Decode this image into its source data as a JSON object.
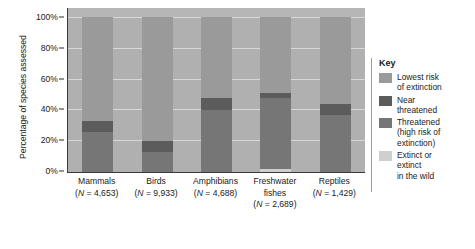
{
  "chart_data": {
    "type": "bar",
    "subtype": "stacked-percentage",
    "title": "",
    "xlabel": "",
    "ylabel": "Percentage of species assessed",
    "ylim": [
      0,
      100
    ],
    "ytick_labels": [
      "0%",
      "20%",
      "40%",
      "60%",
      "80%",
      "100%"
    ],
    "ytick_values": [
      0,
      20,
      40,
      60,
      80,
      100
    ],
    "grid": true,
    "legend_position": "right",
    "categories": [
      "Mammals",
      "Birds",
      "Amphibians",
      "Freshwater fishes",
      "Reptiles"
    ],
    "category_sample_sizes": [
      "(N = 4,653)",
      "(N = 9,933)",
      "(N = 4,688)",
      "(N = 2,689)",
      "(N = 1,429)"
    ],
    "series": [
      {
        "name": "Lowest risk of extinction",
        "color": "#9a9a9a",
        "values": [
          67,
          80,
          52,
          49,
          56
        ]
      },
      {
        "name": "Near threatened",
        "color": "#5c5c5c",
        "values": [
          7,
          7,
          8,
          3,
          7
        ]
      },
      {
        "name": "Threatened (high risk of extinction)",
        "color": "#767676",
        "values": [
          26,
          13,
          40,
          46,
          37
        ]
      },
      {
        "name": "Extinct or extinct in the wild",
        "color": "#cfcfcf",
        "values": [
          0,
          0,
          0,
          2,
          0
        ]
      }
    ]
  },
  "legend": {
    "title": "Key",
    "items": [
      {
        "label": "Lowest risk\nof extinction",
        "line1": "Lowest risk",
        "line2": "of extinction",
        "color": "#9a9a9a"
      },
      {
        "label": "Near\nthreatened",
        "line1": "Near",
        "line2": "threatened",
        "color": "#5c5c5c"
      },
      {
        "label": "Threatened\n(high risk of\nextinction)",
        "line1": "Threatened",
        "line2": "(high risk of",
        "line3": "extinction)",
        "color": "#767676"
      },
      {
        "label": "Extinct or\nextinct\nin the wild",
        "line1": "Extinct or",
        "line2": "extinct",
        "line3": "in the wild",
        "color": "#cfcfcf"
      }
    ]
  },
  "axis": {
    "y_title": "Percentage of species assessed",
    "ticks": [
      {
        "label": "100%",
        "value": 100
      },
      {
        "label": "80%",
        "value": 80
      },
      {
        "label": "60%",
        "value": 60
      },
      {
        "label": "40%",
        "value": 40
      },
      {
        "label": "20%",
        "value": 20
      },
      {
        "label": "0%",
        "value": 0
      }
    ]
  },
  "xaxis_labels": [
    {
      "name": "Mammals",
      "n": "(N = 4,653)",
      "n_prefix": "(",
      "n_italic": "N",
      "n_rest": " = 4,653)"
    },
    {
      "name": "Birds",
      "n": "(N = 9,933)",
      "n_prefix": "(",
      "n_italic": "N",
      "n_rest": " = 9,933)"
    },
    {
      "name": "Amphibians",
      "n": "(N = 4,688)",
      "n_prefix": "(",
      "n_italic": "N",
      "n_rest": " = 4,688)"
    },
    {
      "name": "Freshwater",
      "name2": "fishes",
      "n": "(N = 2,689)",
      "n_prefix": "(",
      "n_italic": "N",
      "n_rest": " = 2,689)"
    },
    {
      "name": "Reptiles",
      "n": "(N = 1,429)",
      "n_prefix": "(",
      "n_italic": "N",
      "n_rest": " = 1,429)"
    }
  ],
  "colors": {
    "plot_background": "#b0b0b0",
    "gridline": "#d8d8d8",
    "axis": "#3a3a3a",
    "lowest_risk": "#9a9a9a",
    "near_threatened": "#5c5c5c",
    "threatened": "#767676",
    "extinct": "#cfcfcf"
  }
}
